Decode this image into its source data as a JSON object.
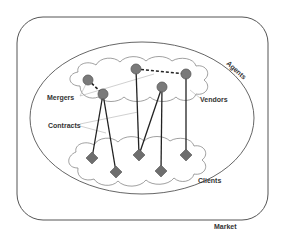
{
  "diagram": {
    "labels": {
      "market": "Market",
      "agents": "Agents",
      "mergers": "Mergers",
      "vendors": "Vendors",
      "contracts": "Contracts",
      "clients": "Clients"
    },
    "colors": {
      "node_fill": "#7a7a7a",
      "node_stroke": "#5a5a5a",
      "diamond_fill": "#6e6e6e",
      "edge": "#222222",
      "pointer": "#b0b0b0",
      "border": "#555555"
    },
    "nodes": {
      "vendors": [
        {
          "id": "v1",
          "x": 88,
          "y": 80
        },
        {
          "id": "v2",
          "x": 103,
          "y": 94
        },
        {
          "id": "v3",
          "x": 136,
          "y": 69
        },
        {
          "id": "v4",
          "x": 162,
          "y": 87
        },
        {
          "id": "v5",
          "x": 186,
          "y": 74
        }
      ],
      "clients": [
        {
          "id": "c1",
          "x": 92,
          "y": 158
        },
        {
          "id": "c2",
          "x": 116,
          "y": 172
        },
        {
          "id": "c3",
          "x": 139,
          "y": 155
        },
        {
          "id": "c4",
          "x": 161,
          "y": 171
        },
        {
          "id": "c5",
          "x": 186,
          "y": 155
        }
      ]
    },
    "edges": {
      "contracts": [
        [
          "v2",
          "c1"
        ],
        [
          "v2",
          "c2"
        ],
        [
          "v3",
          "c3"
        ],
        [
          "v4",
          "c3"
        ],
        [
          "v4",
          "c4"
        ],
        [
          "v5",
          "c5"
        ]
      ],
      "mergers": [
        [
          "v1",
          "v2"
        ],
        [
          "v3",
          "v5"
        ]
      ]
    }
  }
}
